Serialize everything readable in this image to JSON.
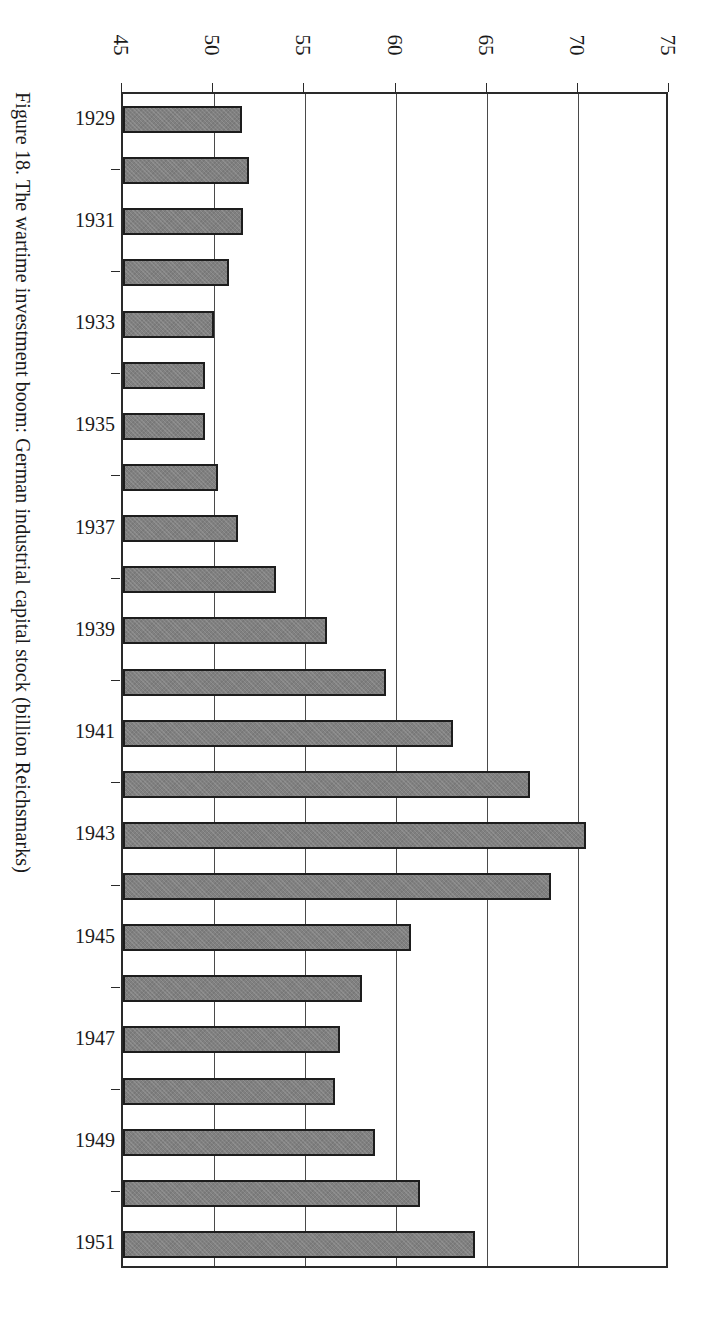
{
  "caption": "Figure 18. The wartime investment boom: German industrial capital stock (billion Reichsmarks)",
  "colors": {
    "bar_fill": "#808080",
    "bar_border": "#1d1d1d",
    "axis": "#2a2a2a",
    "gridline": "#4a4a4a",
    "background": "#ffffff"
  },
  "chart_data": {
    "type": "bar",
    "orientation": "horizontal",
    "title": "Figure 18. The wartime investment boom: German industrial capital stock (billion Reichsmarks)",
    "xlabel": "",
    "ylabel": "",
    "xlim": [
      45,
      75
    ],
    "xticks": [
      45,
      50,
      55,
      60,
      65,
      70,
      75
    ],
    "xtick_labels": [
      "45",
      "50",
      "55",
      "60",
      "65",
      "70",
      "75"
    ],
    "grid": "vertical gridlines at each x tick",
    "legend": "none",
    "axis_position": "x-axis on top, categories on left",
    "units": "billion Reichsmarks",
    "categories": [
      "1929",
      "1930",
      "1931",
      "1932",
      "1933",
      "1934",
      "1935",
      "1936",
      "1937",
      "1938",
      "1939",
      "1940",
      "1941",
      "1942",
      "1943",
      "1944",
      "1945",
      "1946",
      "1947",
      "1948",
      "1949",
      "1950",
      "1951"
    ],
    "category_labels_shown": [
      "1929",
      "",
      "1931",
      "",
      "1933",
      "",
      "1935",
      "",
      "1937",
      "",
      "1939",
      "",
      "1941",
      "",
      "1943",
      "",
      "1945",
      "",
      "1947",
      "",
      "1949",
      "",
      "1951"
    ],
    "values": [
      51.5,
      51.9,
      51.6,
      50.8,
      50.0,
      49.5,
      49.5,
      50.2,
      51.3,
      53.4,
      56.2,
      59.4,
      63.1,
      67.3,
      70.4,
      68.5,
      60.8,
      58.1,
      56.9,
      56.6,
      58.8,
      61.3,
      64.3
    ]
  }
}
